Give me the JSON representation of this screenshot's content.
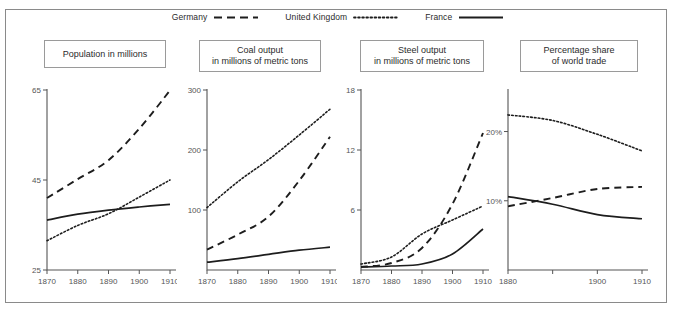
{
  "figure": {
    "border_color": "#8a8a8a",
    "background": "#ffffff"
  },
  "legend": {
    "position": "top-center",
    "entries": [
      {
        "label": "Germany",
        "style": "dashed"
      },
      {
        "label": "United Kingdom",
        "style": "dotted"
      },
      {
        "label": "France",
        "style": "solid"
      }
    ]
  },
  "panels": [
    {
      "title": "Population in millions"
    },
    {
      "title": "Coal output\nin millions of metric tons"
    },
    {
      "title": "Steel output\nin millions of metric tons"
    },
    {
      "title": "Percentage share\nof world trade"
    }
  ],
  "chart_data": [
    {
      "type": "line",
      "title": "Population in millions",
      "xlabel": "",
      "ylabel": "",
      "x": [
        1870,
        1880,
        1890,
        1900,
        1910
      ],
      "xlim": [
        1870,
        1910
      ],
      "ylim": [
        25,
        65
      ],
      "xticks": [
        1870,
        1880,
        1890,
        1900,
        1910
      ],
      "xticklabels": [
        "1870",
        "1880",
        "1890",
        "1900",
        "1910"
      ],
      "yticks": [
        25,
        45,
        65
      ],
      "yticklabels": [
        "25",
        "45",
        "65"
      ],
      "grid": false,
      "legend_position": "figure-top",
      "series": [
        {
          "name": "Germany",
          "style": "dashed",
          "values": [
            41.0,
            45.2,
            49.4,
            56.4,
            64.9
          ]
        },
        {
          "name": "United Kingdom",
          "style": "dotted",
          "values": [
            31.5,
            34.9,
            37.5,
            41.2,
            45.0
          ]
        },
        {
          "name": "France",
          "style": "solid",
          "values": [
            36.1,
            37.4,
            38.3,
            39.0,
            39.6
          ]
        }
      ]
    },
    {
      "type": "line",
      "title": "Coal output in millions of metric tons",
      "xlabel": "",
      "ylabel": "",
      "x": [
        1870,
        1880,
        1890,
        1900,
        1910
      ],
      "xlim": [
        1870,
        1910
      ],
      "ylim": [
        0,
        300
      ],
      "xticks": [
        1870,
        1880,
        1890,
        1900,
        1910
      ],
      "xticklabels": [
        "1870",
        "1880",
        "1890",
        "1900",
        "1910"
      ],
      "yticks": [
        100,
        200,
        300
      ],
      "yticklabels": [
        "100",
        "200",
        "300"
      ],
      "grid": false,
      "legend_position": "figure-top",
      "series": [
        {
          "name": "United Kingdom",
          "style": "dotted",
          "values": [
            104,
            147,
            184,
            225,
            268
          ]
        },
        {
          "name": "Germany",
          "style": "dashed",
          "values": [
            34,
            59,
            89,
            149,
            222
          ]
        },
        {
          "name": "France",
          "style": "solid",
          "values": [
            13,
            19,
            26,
            33,
            38
          ]
        }
      ]
    },
    {
      "type": "line",
      "title": "Steel output in millions of metric tons",
      "xlabel": "",
      "ylabel": "",
      "x": [
        1870,
        1880,
        1890,
        1900,
        1910
      ],
      "xlim": [
        1870,
        1910
      ],
      "ylim": [
        0,
        18
      ],
      "xticks": [
        1870,
        1880,
        1890,
        1900,
        1910
      ],
      "xticklabels": [
        "1870",
        "1880",
        "1890",
        "1900",
        "1910"
      ],
      "yticks": [
        6,
        12,
        18
      ],
      "yticklabels": [
        "6",
        "12",
        "18"
      ],
      "grid": false,
      "legend_position": "figure-top",
      "series": [
        {
          "name": "Germany",
          "style": "dashed",
          "values": [
            0.3,
            0.7,
            2.2,
            6.6,
            13.7
          ]
        },
        {
          "name": "United Kingdom",
          "style": "dotted",
          "values": [
            0.6,
            1.3,
            3.6,
            5.0,
            6.4
          ]
        },
        {
          "name": "France",
          "style": "solid",
          "values": [
            0.3,
            0.4,
            0.6,
            1.6,
            4.1
          ]
        }
      ]
    },
    {
      "type": "line",
      "title": "Percentage share of world trade",
      "xlabel": "",
      "ylabel": "",
      "x": [
        1880,
        1890,
        1900,
        1910
      ],
      "xlim": [
        1880,
        1910
      ],
      "ylim": [
        0,
        26
      ],
      "xticks": [
        1880,
        1890,
        1900,
        1910
      ],
      "xticklabels": [
        "1880",
        "",
        "1900",
        "1910"
      ],
      "yticks": [
        10,
        20
      ],
      "yticklabels": [
        "10%",
        "20%"
      ],
      "grid": false,
      "legend_position": "figure-top",
      "series": [
        {
          "name": "United Kingdom",
          "style": "dotted",
          "values": [
            22.4,
            21.6,
            19.6,
            17.2
          ]
        },
        {
          "name": "Germany",
          "style": "dashed",
          "values": [
            9.2,
            10.4,
            11.7,
            12.0
          ]
        },
        {
          "name": "France",
          "style": "solid",
          "values": [
            10.6,
            9.5,
            8.0,
            7.4
          ]
        }
      ]
    }
  ]
}
